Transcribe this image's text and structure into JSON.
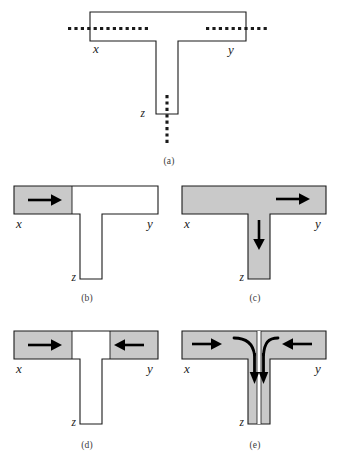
{
  "figure": {
    "kind": "t-junction-flow-diagram",
    "width": 338,
    "height": 469,
    "background_color": "#ffffff",
    "stroke_color": "#1a1a1a",
    "fill_gray": "#c9c9c9",
    "white": "#ffffff"
  },
  "node_labels": {
    "x": "x",
    "y": "y",
    "z": "z"
  },
  "panels": [
    {
      "id": "a",
      "caption": "(a)",
      "labels": {
        "x": "x",
        "y": "y",
        "z": "z"
      },
      "shaded": "none",
      "arrows": [],
      "dotted_leads": [
        "left-arm",
        "right-arm",
        "stem-bottom"
      ]
    },
    {
      "id": "b",
      "caption": "(b)",
      "labels": {
        "x": "x",
        "y": "y",
        "z": "z"
      },
      "shaded": "left-arm-segment",
      "arrows": [
        {
          "name": "arrow-right-x",
          "direction": "right"
        }
      ],
      "dotted_leads": []
    },
    {
      "id": "c",
      "caption": "(c)",
      "labels": {
        "x": "x",
        "y": "y",
        "z": "z"
      },
      "shaded": "whole",
      "arrows": [
        {
          "name": "arrow-right-y",
          "direction": "right"
        },
        {
          "name": "arrow-down-z",
          "direction": "down"
        }
      ],
      "dotted_leads": []
    },
    {
      "id": "d",
      "caption": "(d)",
      "labels": {
        "x": "x",
        "y": "y",
        "z": "z"
      },
      "shaded": "both-arm-segments",
      "arrows": [
        {
          "name": "arrow-right-x",
          "direction": "right"
        },
        {
          "name": "arrow-left-y",
          "direction": "left"
        }
      ],
      "dotted_leads": []
    },
    {
      "id": "e",
      "caption": "(e)",
      "labels": {
        "x": "x",
        "y": "y",
        "z": "z"
      },
      "shaded": "whole-with-split-stem",
      "arrows": [
        {
          "name": "arrow-right-x",
          "direction": "right"
        },
        {
          "name": "arrow-left-y",
          "direction": "left"
        },
        {
          "name": "curved-arrow-left-into-stem",
          "direction": "curve-down"
        },
        {
          "name": "curved-arrow-right-into-stem",
          "direction": "curve-down"
        }
      ],
      "dotted_leads": []
    }
  ],
  "captions": {
    "a": "(a)",
    "b": "(b)",
    "c": "(c)",
    "d": "(d)",
    "e": "(e)"
  }
}
